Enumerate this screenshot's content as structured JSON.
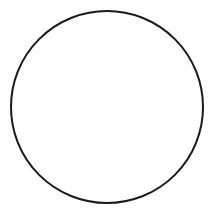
{
  "figure": {
    "name": "circle-divided-into-eighths",
    "background_color": "#ffffff",
    "stroke_color": "#1a1a1a",
    "fill_color": "#ffffff",
    "stroke_width": 2,
    "canvas": {
      "width": 215,
      "height": 210
    },
    "circle": {
      "cx": 107,
      "cy": 107,
      "r": 96
    },
    "sector_count": 8,
    "sector_fraction_label": "1/8",
    "sector_angle_degrees": 45,
    "diameter_lines": [
      {
        "name": "vertical-diameter",
        "angle_degrees": 90,
        "x1": 107,
        "y1": 11,
        "x2": 107,
        "y2": 203
      },
      {
        "name": "horizontal-diameter",
        "angle_degrees": 0,
        "x1": 11,
        "y1": 107,
        "x2": 203,
        "y2": 107
      },
      {
        "name": "diagonal-diameter-ne-sw",
        "angle_degrees": 45,
        "x1": 174.9,
        "y1": 39.1,
        "x2": 39.1,
        "y2": 174.9
      },
      {
        "name": "diagonal-diameter-nw-se",
        "angle_degrees": 135,
        "x1": 39.1,
        "y1": 39.1,
        "x2": 174.9,
        "y2": 174.9
      }
    ],
    "sectors": [
      {
        "index": 1,
        "name": "sector-1",
        "start_degrees": 0,
        "end_degrees": 45,
        "fraction": "1/8",
        "shaded": false
      },
      {
        "index": 2,
        "name": "sector-2",
        "start_degrees": 45,
        "end_degrees": 90,
        "fraction": "1/8",
        "shaded": false
      },
      {
        "index": 3,
        "name": "sector-3",
        "start_degrees": 90,
        "end_degrees": 135,
        "fraction": "1/8",
        "shaded": false
      },
      {
        "index": 4,
        "name": "sector-4",
        "start_degrees": 135,
        "end_degrees": 180,
        "fraction": "1/8",
        "shaded": false
      },
      {
        "index": 5,
        "name": "sector-5",
        "start_degrees": 180,
        "end_degrees": 225,
        "fraction": "1/8",
        "shaded": false
      },
      {
        "index": 6,
        "name": "sector-6",
        "start_degrees": 225,
        "end_degrees": 270,
        "fraction": "1/8",
        "shaded": false
      },
      {
        "index": 7,
        "name": "sector-7",
        "start_degrees": 270,
        "end_degrees": 315,
        "fraction": "1/8",
        "shaded": false
      },
      {
        "index": 8,
        "name": "sector-8",
        "start_degrees": 315,
        "end_degrees": 360,
        "fraction": "1/8",
        "shaded": false
      }
    ]
  },
  "chart_data": {
    "type": "pie",
    "title": "",
    "labels": [
      "1/8",
      "1/8",
      "1/8",
      "1/8",
      "1/8",
      "1/8",
      "1/8",
      "1/8"
    ],
    "values": [
      12.5,
      12.5,
      12.5,
      12.5,
      12.5,
      12.5,
      12.5,
      12.5
    ],
    "total": 100,
    "slice_count": 8,
    "colors": [
      "#ffffff",
      "#ffffff",
      "#ffffff",
      "#ffffff",
      "#ffffff",
      "#ffffff",
      "#ffffff",
      "#ffffff"
    ],
    "stroke_color": "#1a1a1a",
    "legend": "none",
    "grid": false,
    "annotations": []
  }
}
